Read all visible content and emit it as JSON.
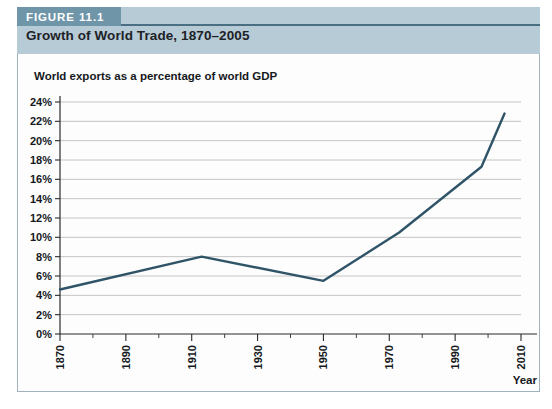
{
  "figure": {
    "tab_label": "FIGURE 11.1",
    "title": "Growth of World Trade, 1870–2005"
  },
  "colors": {
    "tab_background": "#6e95a8",
    "header_band": "#b7cbd6",
    "panel_border": "#9fb3bf",
    "line": "#2f5468",
    "grid": "#b5b5b5",
    "axis": "#2b2b2b",
    "text": "#16191c"
  },
  "chart_data": {
    "type": "line",
    "title": "World exports as a percentage of world GDP",
    "xlabel": "Year",
    "ylabel": "",
    "xlim": [
      1870,
      2010
    ],
    "ylim": [
      0,
      24
    ],
    "ytick_labels": [
      "0%",
      "2%",
      "4%",
      "6%",
      "8%",
      "10%",
      "12%",
      "14%",
      "16%",
      "18%",
      "20%",
      "22%",
      "24%"
    ],
    "ytick_values": [
      0,
      2,
      4,
      6,
      8,
      10,
      12,
      14,
      16,
      18,
      20,
      22,
      24
    ],
    "xtick_labels": [
      "1870",
      "1890",
      "1910",
      "1930",
      "1950",
      "1970",
      "1990",
      "2010"
    ],
    "xtick_values": [
      1870,
      1890,
      1910,
      1930,
      1950,
      1970,
      1990,
      2010
    ],
    "xtick_minor_values": [
      1880,
      1900,
      1920,
      1940,
      1960,
      1980,
      2000
    ],
    "grid": "horizontal",
    "legend": "none",
    "series": [
      {
        "name": "World exports as a percentage of world GDP",
        "x": [
          1870,
          1913,
          1950,
          1973,
          1998,
          2005
        ],
        "values": [
          4.6,
          8.0,
          5.5,
          10.5,
          17.3,
          22.8
        ]
      }
    ]
  }
}
